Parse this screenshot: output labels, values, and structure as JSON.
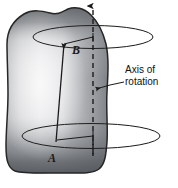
{
  "figure": {
    "name": "rigid-body-rotation-diagram",
    "background_color": "#ffffff",
    "body": {
      "name": "rigid-body-blob",
      "fill_light": "#e9e9e9",
      "fill_mid": "#bdbdbd",
      "fill_dark": "#6f7276",
      "outline_color": "#2a2a2a"
    },
    "axis": {
      "label_line1": "Axis of",
      "label_line2": "rotation",
      "line_color": "#1a1a1a",
      "style": "dashed-vertical-with-top-arrow"
    },
    "points": {
      "point_a_label": "A",
      "point_b_label": "B"
    },
    "circles": {
      "upper_name": "upper-rotation-circle",
      "lower_name": "lower-rotation-circle",
      "stroke_color": "#1a1a1a"
    },
    "caption": {
      "text": "",
      "visible": false
    }
  }
}
